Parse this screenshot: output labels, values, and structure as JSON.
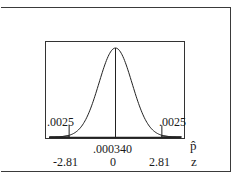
{
  "chart_data": {
    "type": "area",
    "title": "",
    "xlabel_rows": [
      "p-hat",
      "z"
    ],
    "axis_symbols": {
      "phat": "p̂",
      "z": "z"
    },
    "center_phat_label": ".000340",
    "z_ticks": [
      "-2.81",
      "0",
      "2.81"
    ],
    "z_values": [
      -2.81,
      0,
      2.81
    ],
    "tail_area_labels": {
      "left": ".0025",
      "right": ".0025"
    },
    "tail_areas": [
      0.0025,
      0.0025
    ],
    "critical_z": 2.81,
    "center_phat": 0.00034,
    "grid": false,
    "legend": null
  }
}
